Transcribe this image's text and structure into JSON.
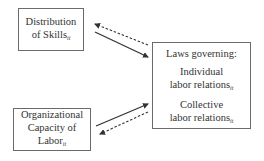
{
  "diagram": {
    "nodes": [
      {
        "id": "skills",
        "lines": [
          "Distribution",
          "of Skills"
        ],
        "subscript": "it"
      },
      {
        "id": "laws",
        "heading": "Laws governing:",
        "items": [
          {
            "lines": [
              "Individual",
              "labor relations"
            ],
            "subscript": "it"
          },
          {
            "lines": [
              "Collective",
              "labor relations"
            ],
            "subscript": "it"
          }
        ]
      },
      {
        "id": "org",
        "lines": [
          "Organizational",
          "Capacity of",
          "Labor"
        ],
        "subscript": "it"
      }
    ],
    "edges": [
      {
        "from": "skills",
        "to": "laws",
        "style": "solid"
      },
      {
        "from": "laws",
        "to": "skills",
        "style": "dashed"
      },
      {
        "from": "org",
        "to": "laws",
        "style": "solid"
      },
      {
        "from": "laws",
        "to": "org",
        "style": "dashed"
      }
    ],
    "colors": {
      "line": "#333333",
      "border": "#6a6a6a",
      "background": "#ffffff"
    }
  }
}
